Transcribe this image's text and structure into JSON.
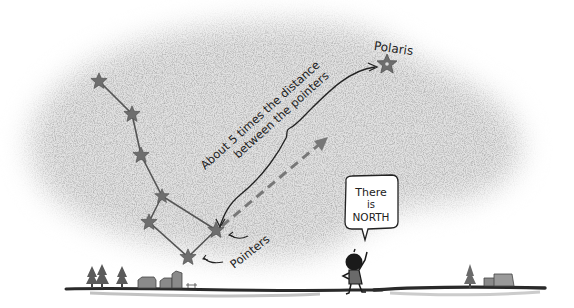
{
  "illustration": {
    "title": "Finding the North Star",
    "labels": {
      "polaris": "Polaris",
      "distance_line1": "About 5 times the distance",
      "distance_line2": "between the pointers",
      "pointers": "Pointers",
      "speech_line1": "There",
      "speech_line2": "is",
      "speech_line3": "NORTH"
    },
    "colors": {
      "sky_shading": "#9a9a9a",
      "star": "#6e6e6e",
      "ink": "#1e1e1e",
      "ground": "#2a2a2a"
    },
    "constellation": {
      "name": "Big Dipper",
      "stars": [
        {
          "id": "alkaid",
          "x": 99,
          "y": 81
        },
        {
          "id": "mizar",
          "x": 132,
          "y": 114
        },
        {
          "id": "alioth",
          "x": 141,
          "y": 155
        },
        {
          "id": "megrez",
          "x": 162,
          "y": 196
        },
        {
          "id": "phecda",
          "x": 149,
          "y": 222
        },
        {
          "id": "merak",
          "x": 188,
          "y": 257
        },
        {
          "id": "dubhe",
          "x": 216,
          "y": 230
        }
      ],
      "polaris": {
        "x": 387,
        "y": 64
      }
    }
  }
}
